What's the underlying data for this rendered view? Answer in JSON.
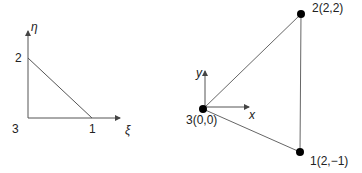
{
  "left_diagram": {
    "title": "Parent (natural coordinate) triangle",
    "axes": {
      "horizontal": "ξ",
      "vertical": "η"
    },
    "nodes": [
      {
        "id": "1",
        "label": "1"
      },
      {
        "id": "2",
        "label": "2"
      },
      {
        "id": "3",
        "label": "3"
      }
    ]
  },
  "right_diagram": {
    "title": "Physical triangle element",
    "axes": {
      "horizontal": "x",
      "vertical": "y"
    },
    "nodes": [
      {
        "id": "1",
        "label": "1(2,−1)",
        "coords": [
          2,
          -1
        ]
      },
      {
        "id": "2",
        "label": "2(2,2)",
        "coords": [
          2,
          2
        ]
      },
      {
        "id": "3",
        "label": "3(0,0)",
        "coords": [
          0,
          0
        ]
      }
    ]
  },
  "colors": {
    "line": "#555555",
    "node": "#000000",
    "text": "#222222"
  }
}
